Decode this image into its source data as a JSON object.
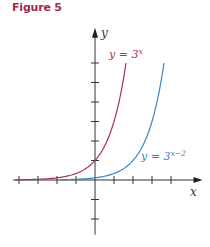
{
  "figure": {
    "title": "Figure 5"
  },
  "colors": {
    "title": "#9b2c48",
    "axis": "#333333",
    "curve1": "#a63446",
    "curve2": "#3a85c4"
  },
  "chart_data": {
    "type": "line",
    "title": "Figure 5",
    "xlabel": "x",
    "ylabel": "y",
    "xlim": [
      -4.3,
      5.5
    ],
    "ylim": [
      -2.8,
      7.6
    ],
    "x_ticks": [
      -4,
      -3,
      -2,
      -1,
      1,
      2,
      3,
      4
    ],
    "y_ticks": [
      -2,
      -1,
      1,
      2,
      3,
      4,
      5,
      6
    ],
    "grid": false,
    "series": [
      {
        "name": "y = 3^x",
        "label_main": "y = 3",
        "label_exp": "x",
        "expr": "3^x",
        "shift": 0,
        "x_range": [
          -4.2,
          1.63
        ],
        "color_key": "curve1"
      },
      {
        "name": "y = 3^(x−2)",
        "label_main": "y = 3",
        "label_exp": "x−2",
        "expr": "3^(x-2)",
        "shift": 2,
        "x_range": [
          -1.8,
          3.63
        ],
        "color_key": "curve2"
      }
    ]
  }
}
